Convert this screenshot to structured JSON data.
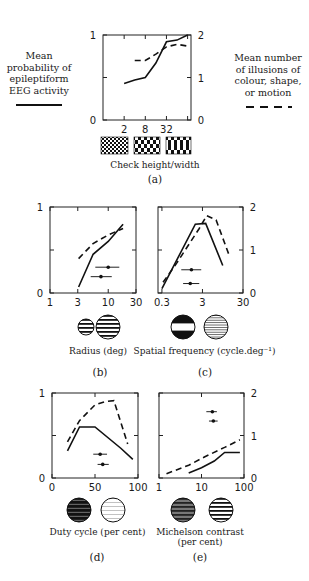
{
  "legend": {
    "left": {
      "text": "Mean\nprobability of\nepileptiform\nEEG activity",
      "line_style": "solid"
    },
    "right": {
      "text": "Mean number\nof illusions of\ncolour, shape,\nor motion",
      "line_style": "dashed"
    }
  },
  "panels": {
    "a": {
      "id_label": "(a)",
      "caption": "Check height/width"
    },
    "b": {
      "id_label": "(b)",
      "caption": "Radius (deg)"
    },
    "c": {
      "id_label": "(c)",
      "caption": "Spatial frequency (cycle.deg⁻¹)"
    },
    "d": {
      "id_label": "(d)",
      "caption": "Duty cycle (per cent)"
    },
    "e": {
      "id_label": "(e)",
      "caption_line1": "Michelson contrast",
      "caption_line2": "(per cent)"
    }
  },
  "chart_data": [
    {
      "panel": "a",
      "type": "line",
      "title": "",
      "xlabel": "Check height/width",
      "ylabel_left": "Mean probability of epileptiform EEG activity",
      "ylabel_right": "Mean number of illusions of colour, shape, or motion",
      "x_scale": "log",
      "x_ticks": [
        2,
        8,
        32,
        128
      ],
      "x_tick_labels": [
        "2",
        "8",
        "32",
        ""
      ],
      "xlim": [
        0.5,
        160
      ],
      "y_left_ticks": [
        0,
        0.5,
        1
      ],
      "y_left_tick_labels": [
        "0",
        "",
        "1"
      ],
      "ylim_left": [
        0,
        1
      ],
      "y_right_ticks": [
        0,
        1,
        2
      ],
      "y_right_tick_labels": [
        "0",
        "1",
        "2"
      ],
      "ylim_right": [
        0,
        2
      ],
      "series": [
        {
          "name": "Mean probability of epileptiform EEG activity",
          "style": "solid",
          "axis": "left",
          "x": [
            2,
            4,
            8,
            16,
            32,
            64,
            128
          ],
          "y": [
            0.43,
            0.47,
            0.5,
            0.67,
            0.92,
            0.94,
            1.0
          ]
        },
        {
          "name": "Mean number of illusions",
          "style": "dashed",
          "axis": "right",
          "x": [
            4,
            8,
            16,
            32,
            64,
            128
          ],
          "y": [
            1.4,
            1.4,
            1.55,
            1.72,
            1.78,
            1.74
          ]
        }
      ],
      "error_bars": []
    },
    {
      "panel": "b",
      "type": "line",
      "xlabel": "Radius (deg)",
      "x_scale": "log",
      "x_ticks": [
        1,
        3,
        10,
        30
      ],
      "x_tick_labels": [
        "1",
        "3",
        "10",
        "30"
      ],
      "xlim": [
        1,
        30
      ],
      "y_left_ticks": [
        0,
        0.5,
        1
      ],
      "y_left_tick_labels": [
        "0",
        "",
        "1"
      ],
      "ylim_left": [
        0,
        1
      ],
      "y_right_ticks": [
        0,
        1,
        2
      ],
      "y_right_tick_labels": [
        "",
        "",
        ""
      ],
      "ylim_right": [
        0,
        2
      ],
      "series": [
        {
          "name": "Mean probability of epileptiform EEG activity",
          "style": "solid",
          "axis": "left",
          "x": [
            3.1,
            5.5,
            10,
            18
          ],
          "y": [
            0.07,
            0.45,
            0.6,
            0.8
          ]
        },
        {
          "name": "Mean number of illusions",
          "style": "dashed",
          "axis": "right",
          "x": [
            3.1,
            5.5,
            10,
            18
          ],
          "y": [
            0.8,
            1.15,
            1.35,
            1.5
          ]
        }
      ],
      "error_bars": [
        {
          "x": 10,
          "y_frac": 0.3,
          "xmin": 6,
          "xmax": 15.5
        },
        {
          "x": 7.5,
          "y_frac": 0.19,
          "xmin": 5,
          "xmax": 11.5
        }
      ]
    },
    {
      "panel": "c",
      "type": "line",
      "xlabel": "Spatial frequency (cycle.deg-1)",
      "x_scale": "log",
      "x_ticks": [
        0.3,
        3,
        30
      ],
      "x_tick_labels": [
        "0.3",
        "3",
        "30"
      ],
      "xlim": [
        0.24,
        30
      ],
      "y_left_ticks": [
        0,
        0.5,
        1
      ],
      "y_left_tick_labels": [
        "",
        "",
        ""
      ],
      "ylim_left": [
        0,
        1
      ],
      "y_right_ticks": [
        0,
        1,
        2
      ],
      "y_right_tick_labels": [
        "0",
        "1",
        "2"
      ],
      "ylim_right": [
        0,
        2
      ],
      "series": [
        {
          "name": "Mean probability of epileptiform EEG activity",
          "style": "solid",
          "axis": "left",
          "x": [
            0.3,
            2.0,
            3.6,
            9.5
          ],
          "y": [
            0.05,
            0.8,
            0.81,
            0.32
          ]
        },
        {
          "name": "Mean number of illusions",
          "style": "dashed",
          "axis": "right",
          "x": [
            0.32,
            0.7,
            2.5,
            3.8,
            6.5,
            14
          ],
          "y": [
            0.25,
            0.7,
            1.5,
            1.8,
            1.7,
            0.85
          ]
        }
      ],
      "error_bars": [
        {
          "x": 1.6,
          "y_frac": 0.27,
          "xmin": 0.9,
          "xmax": 2.8
        },
        {
          "x": 1.5,
          "y_frac": 0.11,
          "xmin": 1.0,
          "xmax": 2.5
        }
      ]
    },
    {
      "panel": "d",
      "type": "line",
      "xlabel": "Duty cycle (per cent)",
      "x_scale": "linear",
      "x_ticks": [
        0,
        50,
        100
      ],
      "x_tick_labels": [
        "0",
        "50",
        "100"
      ],
      "xlim": [
        0,
        100
      ],
      "y_left_ticks": [
        0,
        0.5,
        1
      ],
      "y_left_tick_labels": [
        "0",
        "",
        "1"
      ],
      "ylim_left": [
        0,
        1
      ],
      "y_right_ticks": [
        0,
        1,
        2
      ],
      "y_right_tick_labels": [
        "",
        "",
        ""
      ],
      "ylim_right": [
        0,
        2
      ],
      "series": [
        {
          "name": "Mean probability of epileptiform EEG activity",
          "style": "solid",
          "axis": "left",
          "x": [
            18,
            32,
            50,
            80,
            94
          ],
          "y": [
            0.32,
            0.6,
            0.6,
            0.35,
            0.22
          ]
        },
        {
          "name": "Mean number of illusions",
          "style": "dashed",
          "axis": "right",
          "x": [
            18,
            32,
            50,
            62,
            72,
            88
          ],
          "y": [
            0.85,
            1.35,
            1.72,
            1.8,
            1.82,
            0.8
          ]
        }
      ],
      "error_bars": [
        {
          "x": 56,
          "y_frac": 0.28,
          "xmin": 48,
          "xmax": 64
        },
        {
          "x": 59,
          "y_frac": 0.16,
          "xmin": 53,
          "xmax": 66
        }
      ]
    },
    {
      "panel": "e",
      "type": "line",
      "xlabel": "Michelson contrast (per cent)",
      "x_scale": "log",
      "x_ticks": [
        1,
        10,
        100
      ],
      "x_tick_labels": [
        "1",
        "10",
        "100"
      ],
      "xlim": [
        1,
        100
      ],
      "y_left_ticks": [
        0,
        0.5,
        1
      ],
      "y_left_tick_labels": [
        "",
        "",
        ""
      ],
      "ylim_left": [
        0,
        1
      ],
      "y_right_ticks": [
        0,
        1,
        2
      ],
      "y_right_tick_labels": [
        "0",
        "1",
        "2"
      ],
      "ylim_right": [
        0,
        2
      ],
      "series": [
        {
          "name": "Mean probability of epileptiform EEG activity",
          "style": "solid",
          "axis": "left",
          "x": [
            5,
            10,
            20,
            35,
            80
          ],
          "y": [
            0.06,
            0.12,
            0.2,
            0.3,
            0.3
          ]
        },
        {
          "name": "Mean number of illusions",
          "style": "dashed",
          "axis": "right",
          "x": [
            1.5,
            5,
            12,
            35,
            80
          ],
          "y": [
            0.1,
            0.3,
            0.5,
            0.72,
            0.9
          ]
        }
      ],
      "error_bars": [
        {
          "x": 18,
          "y_frac": 0.78,
          "xmin": 13,
          "xmax": 23
        },
        {
          "x": 19,
          "y_frac": 0.67,
          "xmin": 15,
          "xmax": 24
        }
      ]
    }
  ]
}
